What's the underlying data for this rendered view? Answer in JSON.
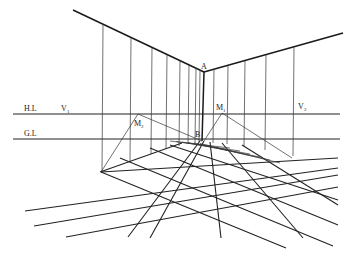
{
  "diagram": {
    "labels": {
      "horizon_line": "H.L",
      "ground_line": "G.L",
      "vp_left": "V",
      "vp_left_sub": "1",
      "vp_right": "V",
      "vp_right_sub": "2",
      "corner_top": "A",
      "corner_bottom": "B",
      "measure_left": "M",
      "measure_left_sub": "2",
      "measure_right": "M",
      "measure_right_sub": "1"
    },
    "colors": {
      "ink": "#1a1a1a",
      "background": "#ffffff"
    }
  }
}
